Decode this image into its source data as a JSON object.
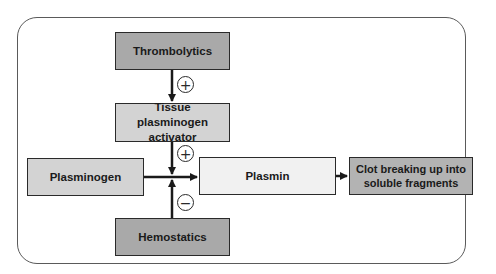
{
  "diagram": {
    "type": "flowchart",
    "nodes": {
      "thrombolytics": "Thrombolytics",
      "tpa": "Tissue plasminogen activator",
      "plasminogen": "Plasminogen",
      "plasmin": "Plasmin",
      "clot": "Clot breaking up into soluble fragments",
      "hemostatics": "Hemostatics"
    },
    "signs": {
      "thrombolytics_to_tpa": "+",
      "tpa_to_conversion": "+",
      "hemostatics_to_conversion": "−"
    },
    "edges": [
      {
        "from": "Thrombolytics",
        "to": "Tissue plasminogen activator",
        "effect": "+"
      },
      {
        "from": "Tissue plasminogen activator",
        "to": "Plasminogen→Plasmin conversion",
        "effect": "+"
      },
      {
        "from": "Hemostatics",
        "to": "Plasminogen→Plasmin conversion",
        "effect": "−"
      },
      {
        "from": "Plasminogen",
        "to": "Plasmin"
      },
      {
        "from": "Plasmin",
        "to": "Clot breaking up into soluble fragments"
      }
    ],
    "colors": {
      "dark_box": "#a9a9a9",
      "mid_box": "#d3d3d3",
      "light_box": "#f1f1f1",
      "clot_box": "#b3b3b3",
      "stroke": "#2a2a2a"
    }
  }
}
